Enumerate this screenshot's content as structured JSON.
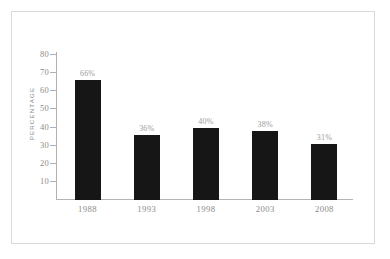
{
  "chart_data": {
    "type": "bar",
    "title": "",
    "xlabel": "",
    "ylabel": "PERCENTAGE",
    "categories": [
      "1988",
      "1993",
      "1998",
      "2003",
      "2008"
    ],
    "values": [
      66,
      36,
      40,
      38,
      31
    ],
    "value_labels": [
      "66%",
      "36%",
      "40%",
      "38%",
      "31%"
    ],
    "ylim": [
      0,
      80
    ],
    "yticks": [
      10,
      20,
      30,
      40,
      50,
      60,
      70,
      80
    ],
    "ytick_labels": [
      "10",
      "20",
      "30",
      "40",
      "50",
      "60",
      "70",
      "80"
    ],
    "grid": false,
    "legend": false,
    "bar_color": "#161616",
    "axis_color": "#b0b0b0",
    "text_color": "#8b8b8b",
    "frame_color": "#d9d9d9",
    "background": "#ffffff"
  }
}
